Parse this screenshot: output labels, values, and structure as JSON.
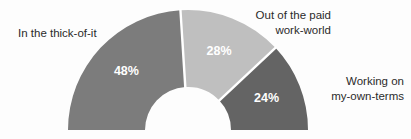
{
  "chart_data": {
    "type": "pie",
    "variant": "semicircle-donut",
    "title": "",
    "subtitle": "",
    "xlabel": "",
    "ylabel": "",
    "legend_position": "callout-labels",
    "grid": false,
    "total_degrees": 180,
    "categories": [
      "In the thick-of-it",
      "Out of the paid work-world",
      "Working on my-own-terms"
    ],
    "values": [
      48,
      28,
      24
    ],
    "value_labels": [
      "48%",
      "28%",
      "24%"
    ],
    "colors": [
      "#7c7c7c",
      "#bfbfbf",
      "#646464"
    ],
    "slices": [
      {
        "label": "In the thick-of-it",
        "value": 48,
        "value_label": "48%",
        "color": "#7c7c7c",
        "start_angle": 180,
        "sweep_angle": 86.4
      },
      {
        "label": "Out of the paid work-world",
        "value": 28,
        "value_label": "28%",
        "color": "#bfbfbf",
        "start_angle": 93.6,
        "sweep_angle": 50.4
      },
      {
        "label": "Working on my-own-terms",
        "value": 24,
        "value_label": "24%",
        "color": "#646464",
        "start_angle": 43.2,
        "sweep_angle": 43.2
      }
    ]
  },
  "labels": {
    "thick_of_it": "In the thick-of-it",
    "out_of_paid": "Out of the paid\nwork-world",
    "working_own_terms": "Working on\nmy-own-terms"
  },
  "values": {
    "thick_of_it": "48%",
    "out_of_paid": "28%",
    "working_own_terms": "24%"
  },
  "theme": {
    "background": "#fdfdfd",
    "divider": "#ffffff",
    "label_text": "#2b2b2b",
    "value_text": "#ffffff"
  }
}
